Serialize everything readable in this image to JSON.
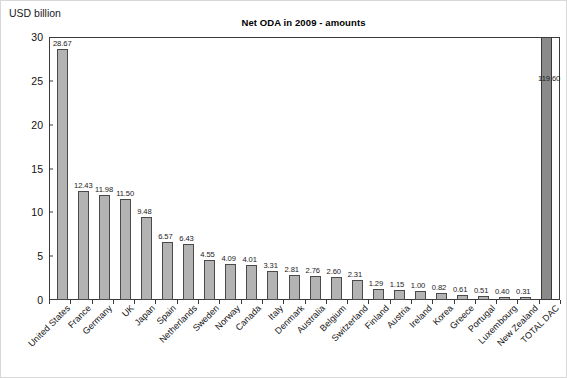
{
  "unit_label": "USD billion",
  "chart_data": {
    "type": "bar",
    "title": "Net ODA in 2009 - amounts",
    "xlabel": "",
    "ylabel": "USD billion",
    "ylim": [
      0,
      30
    ],
    "yticks": [
      0,
      5,
      10,
      15,
      20,
      25,
      30
    ],
    "ytick_labels": [
      "0",
      "5",
      "10",
      "15",
      "20",
      "25",
      "30"
    ],
    "grid": false,
    "legend": "none",
    "note": "The TOTAL DAC bar (119.60) exceeds the 0-30 axis range and is drawn clipped at the top of the plot in a darker fill.",
    "categories": [
      "United States",
      "France",
      "Germany",
      "UK",
      "Japan",
      "Spain",
      "Netherlands",
      "Sweden",
      "Norway",
      "Canada",
      "Italy",
      "Denmark",
      "Australia",
      "Belgium",
      "Switzerland",
      "Finland",
      "Austria",
      "Ireland",
      "Korea",
      "Greece",
      "Portugal",
      "Luxembourg",
      "New Zealand",
      "TOTAL DAC"
    ],
    "values": [
      28.67,
      12.43,
      11.98,
      11.5,
      9.48,
      6.57,
      6.43,
      4.55,
      4.09,
      4.01,
      3.31,
      2.81,
      2.76,
      2.6,
      2.31,
      1.29,
      1.15,
      1.0,
      0.82,
      0.61,
      0.51,
      0.4,
      0.31,
      119.6
    ],
    "value_labels": [
      "28.67",
      "12.43",
      "11.98",
      "11.50",
      "9.48",
      "6.57",
      "6.43",
      "4.55",
      "4.09",
      "4.01",
      "3.31",
      "2.81",
      "2.76",
      "2.60",
      "2.31",
      "1.29",
      "1.15",
      "1.00",
      "0.82",
      "0.61",
      "0.51",
      "0.40",
      "0.31",
      "119.60"
    ],
    "bar_color": "#b3b3b3",
    "total_bar_color": "#8a8a8a",
    "bar_border_color": "#4a4a4a",
    "axis_color": "#3a3a3a",
    "text_color": "#111111"
  }
}
